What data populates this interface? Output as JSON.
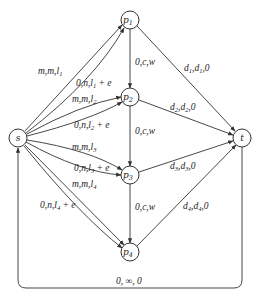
{
  "diagram": {
    "type": "flow-network",
    "nodes": [
      {
        "id": "s",
        "label": "s",
        "sub": "",
        "x": 18,
        "y": 138
      },
      {
        "id": "p1",
        "label": "p",
        "sub": "1",
        "x": 130,
        "y": 20
      },
      {
        "id": "p2",
        "label": "p",
        "sub": "2",
        "x": 130,
        "y": 97
      },
      {
        "id": "p3",
        "label": "p",
        "sub": "3",
        "x": 130,
        "y": 175
      },
      {
        "id": "p4",
        "label": "p",
        "sub": "4",
        "x": 130,
        "y": 252
      },
      {
        "id": "t",
        "label": "t",
        "sub": "",
        "x": 242,
        "y": 138
      }
    ],
    "edges": [
      {
        "from": "s",
        "to": "p1",
        "label": "m,m,l",
        "sub": "1",
        "suffix": ""
      },
      {
        "from": "s",
        "to": "p1",
        "label": "0,n,l",
        "sub": "1",
        "suffix": " + e"
      },
      {
        "from": "s",
        "to": "p2",
        "label": "m,m,l",
        "sub": "2",
        "suffix": ""
      },
      {
        "from": "s",
        "to": "p2",
        "label": "0,n,l",
        "sub": "2",
        "suffix": " + e"
      },
      {
        "from": "s",
        "to": "p3",
        "label": "m,m,l",
        "sub": "3",
        "suffix": ""
      },
      {
        "from": "s",
        "to": "p3",
        "label": "0,n,l",
        "sub": "3",
        "suffix": " + e"
      },
      {
        "from": "s",
        "to": "p4",
        "label": "m,m,l",
        "sub": "4",
        "suffix": ""
      },
      {
        "from": "s",
        "to": "p4",
        "label": "0,n,l",
        "sub": "4",
        "suffix": " + e"
      },
      {
        "from": "p1",
        "to": "p2",
        "label": "0,c,w"
      },
      {
        "from": "p2",
        "to": "p3",
        "label": "0,c,w"
      },
      {
        "from": "p3",
        "to": "p4",
        "label": "0,c,w"
      },
      {
        "from": "p1",
        "to": "t",
        "label": "d",
        "sub": "1",
        "mid": ",d",
        "sub2": "1",
        "suffix": ",0"
      },
      {
        "from": "p2",
        "to": "t",
        "label": "d",
        "sub": "2",
        "mid": ",d",
        "sub2": "2",
        "suffix": ",0"
      },
      {
        "from": "p3",
        "to": "t",
        "label": "d",
        "sub": "3",
        "mid": ",d",
        "sub2": "3",
        "suffix": ",0"
      },
      {
        "from": "p4",
        "to": "t",
        "label": "d",
        "sub": "4",
        "mid": ",d",
        "sub2": "4",
        "suffix": ",0"
      },
      {
        "from": "t",
        "to": "s",
        "label": "0, ∞, 0"
      }
    ]
  },
  "labels": {
    "s": "s",
    "t": "t",
    "p": "p",
    "one": "1",
    "two": "2",
    "three": "3",
    "four": "4",
    "mml": "m,m,l",
    "onl": "0,n,l",
    "plus_e": " + e",
    "vert": "0,c,w",
    "d": "d",
    "cd": ",d",
    "c0": ",0",
    "return": "0, ∞, 0"
  }
}
